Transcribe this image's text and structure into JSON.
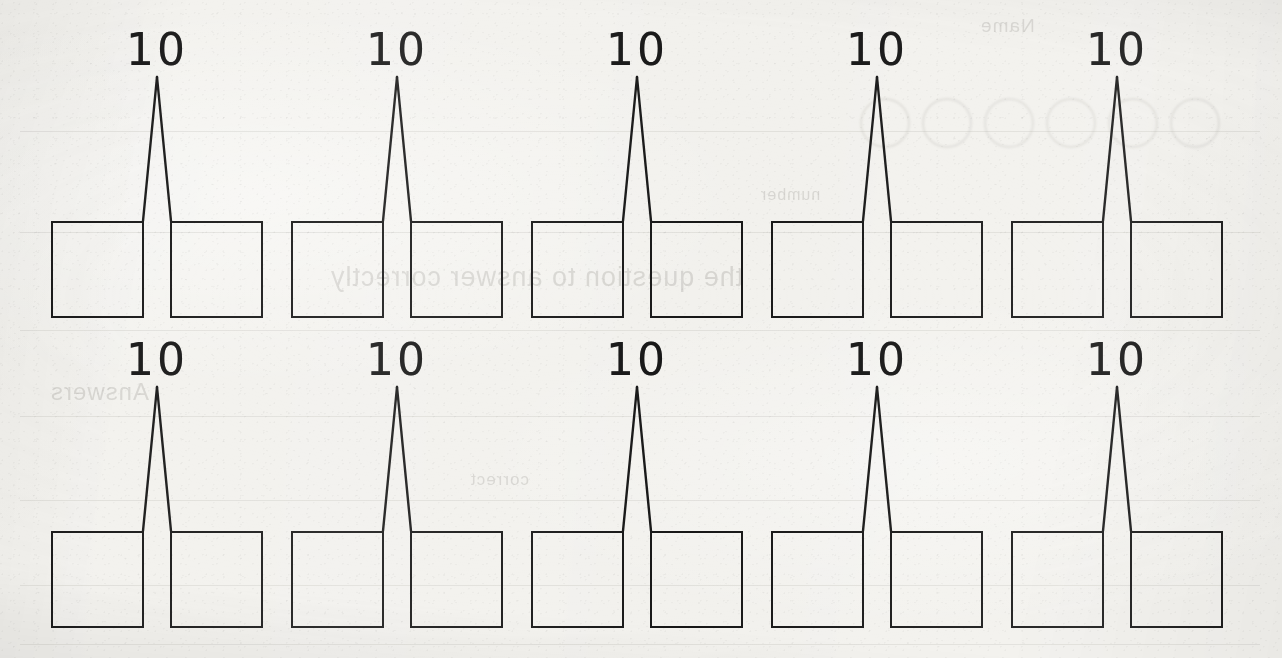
{
  "worksheet": {
    "title": "Number Bond Worksheet",
    "paper_color": "#f2f1ed",
    "ink_color": "#161616",
    "rows": 2,
    "columns": 5,
    "total_bonds": 10
  },
  "bonds": [
    {
      "id": "bond-1",
      "row": 1,
      "col": 1,
      "total": "10",
      "left_box_value": "",
      "right_box_value": ""
    },
    {
      "id": "bond-2",
      "row": 1,
      "col": 2,
      "total": "10",
      "left_box_value": "",
      "right_box_value": ""
    },
    {
      "id": "bond-3",
      "row": 1,
      "col": 3,
      "total": "10",
      "left_box_value": "",
      "right_box_value": ""
    },
    {
      "id": "bond-4",
      "row": 1,
      "col": 4,
      "total": "10",
      "left_box_value": "",
      "right_box_value": ""
    },
    {
      "id": "bond-5",
      "row": 1,
      "col": 5,
      "total": "10",
      "left_box_value": "",
      "right_box_value": ""
    },
    {
      "id": "bond-6",
      "row": 2,
      "col": 1,
      "total": "10",
      "left_box_value": "",
      "right_box_value": ""
    },
    {
      "id": "bond-7",
      "row": 2,
      "col": 2,
      "total": "10",
      "left_box_value": "",
      "right_box_value": ""
    },
    {
      "id": "bond-8",
      "row": 2,
      "col": 3,
      "total": "10",
      "left_box_value": "",
      "right_box_value": ""
    },
    {
      "id": "bond-9",
      "row": 2,
      "col": 4,
      "total": "10",
      "left_box_value": "",
      "right_box_value": ""
    },
    {
      "id": "bond-10",
      "row": 2,
      "col": 5,
      "total": "10",
      "left_box_value": "",
      "right_box_value": ""
    }
  ],
  "layout": {
    "row_tops": [
      221,
      531
    ],
    "label_tops": [
      28,
      338
    ],
    "group_lefts": [
      51,
      291,
      531,
      771,
      1011
    ],
    "box_width": 93,
    "box_height": 97,
    "box_gap": 26,
    "apex_offset_y": 47
  },
  "bleed_through": {
    "note": "Faint mirrored show-through from the reverse side of the page",
    "lines": [
      {
        "text": "the question to answer correctly",
        "x": 330,
        "y": 262,
        "size": 27
      },
      {
        "text": "Answers",
        "x": 50,
        "y": 378,
        "size": 24
      },
      {
        "text": "correct",
        "x": 470,
        "y": 470,
        "size": 17
      },
      {
        "text": "number",
        "x": 760,
        "y": 186,
        "size": 16
      },
      {
        "text": "Name",
        "x": 980,
        "y": 15,
        "size": 19
      }
    ],
    "circles": [
      {
        "x": 860,
        "y": 98,
        "d": 46
      },
      {
        "x": 922,
        "y": 98,
        "d": 46
      },
      {
        "x": 984,
        "y": 98,
        "d": 46
      },
      {
        "x": 1046,
        "y": 98,
        "d": 46
      },
      {
        "x": 1108,
        "y": 98,
        "d": 46
      },
      {
        "x": 1170,
        "y": 98,
        "d": 46
      }
    ]
  }
}
